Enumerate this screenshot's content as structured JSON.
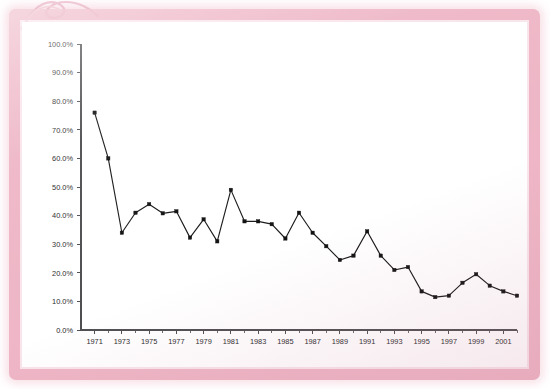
{
  "figure": {
    "kind": "line-chart-photo",
    "frame_color": "#eeb6c6",
    "panel_background": "#ffffff",
    "scribble_name": "pink-scribble-mark"
  },
  "chart_data": {
    "type": "line",
    "title": "",
    "subtitle": "",
    "xlabel": "",
    "ylabel": "",
    "grid": false,
    "legend": false,
    "legend_position": "none",
    "line_color": "#1a1a1a",
    "marker": "square",
    "marker_color": "#121212",
    "xlim": [
      1970,
      2002
    ],
    "ylim": [
      0,
      100
    ],
    "y_tick_step": 10,
    "y_tick_labels": [
      "0.0%",
      "10.0%",
      "20.0%",
      "30.0%",
      "40.0%",
      "50.0%",
      "60.0%",
      "70.0%",
      "80.0%",
      "90.0%",
      "100.0%"
    ],
    "y_tick_values": [
      0,
      10,
      20,
      30,
      40,
      50,
      60,
      70,
      80,
      90,
      100
    ],
    "x_tick_labels": [
      "1971",
      "1973",
      "1975",
      "1977",
      "1979",
      "1981",
      "1983",
      "1985",
      "1987",
      "1989",
      "1991",
      "1993",
      "1995",
      "1997",
      "1999",
      "2001"
    ],
    "x_tick_label_values": [
      1971,
      1973,
      1975,
      1977,
      1979,
      1981,
      1983,
      1985,
      1987,
      1989,
      1991,
      1993,
      1995,
      1997,
      1999,
      2001
    ],
    "x_minor_ticks": [
      1972,
      1974,
      1976,
      1978,
      1980,
      1982,
      1984,
      1986,
      1988,
      1990,
      1992,
      1994,
      1996,
      1998,
      2000,
      2002
    ],
    "x": [
      1971,
      1972,
      1973,
      1974,
      1975,
      1976,
      1977,
      1978,
      1979,
      1980,
      1981,
      1982,
      1983,
      1984,
      1985,
      1986,
      1987,
      1988,
      1989,
      1990,
      1991,
      1992,
      1993,
      1994,
      1995,
      1996,
      1997,
      1998,
      1999,
      2000,
      2001,
      2002
    ],
    "values": [
      76.0,
      60.0,
      34.0,
      41.0,
      44.0,
      40.8,
      41.5,
      32.3,
      38.7,
      31.0,
      49.0,
      38.0,
      38.0,
      37.0,
      32.0,
      41.0,
      34.0,
      29.3,
      24.5,
      26.0,
      34.5,
      26.0,
      21.0,
      22.0,
      13.5,
      11.5,
      12.0,
      16.5,
      19.5,
      15.5,
      13.5,
      12.0
    ],
    "series": [
      {
        "name": "",
        "values": [
          76.0,
          60.0,
          34.0,
          41.0,
          44.0,
          40.8,
          41.5,
          32.3,
          38.7,
          31.0,
          49.0,
          38.0,
          38.0,
          37.0,
          32.0,
          41.0,
          34.0,
          29.3,
          24.5,
          26.0,
          34.5,
          26.0,
          21.0,
          22.0,
          13.5,
          11.5,
          12.0,
          16.5,
          19.5,
          15.5,
          13.5,
          12.0
        ]
      }
    ]
  }
}
